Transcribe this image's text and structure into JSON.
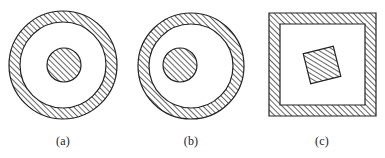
{
  "figure": {
    "background": "#ffffff",
    "stroke_color": "#222222",
    "hatch": {
      "angle_deg": 45,
      "spacing_px": 4,
      "color": "#333333"
    },
    "panels": [
      {
        "id": "a",
        "label": "(a)",
        "label_x": 63,
        "outer_shape": "annulus",
        "outer": {
          "cx": 63,
          "cy": 65,
          "r_outer": 54,
          "r_inner": 43
        },
        "inner_shape": "circle",
        "inner": {
          "cx": 64,
          "cy": 65,
          "r": 17
        },
        "description": "Concentric hatched circle inside hatched ring"
      },
      {
        "id": "b",
        "label": "(b)",
        "label_x": 191,
        "outer_shape": "annulus",
        "outer": {
          "cx": 191,
          "cy": 66,
          "r_outer": 53,
          "r_inner": 42
        },
        "inner_shape": "circle",
        "inner": {
          "cx": 180,
          "cy": 65,
          "r": 17
        },
        "description": "Off-center hatched circle inside hatched ring"
      },
      {
        "id": "c",
        "label": "(c)",
        "label_x": 322,
        "outer_shape": "square-frame",
        "outer": {
          "x": 269,
          "y": 13,
          "width": 107,
          "height": 103,
          "thickness": 11
        },
        "inner_shape": "rotated-square",
        "inner": {
          "cx": 322,
          "cy": 65,
          "side": 31,
          "rotation_deg": -14
        },
        "description": "Rotated hatched square inside hatched square frame"
      }
    ]
  }
}
